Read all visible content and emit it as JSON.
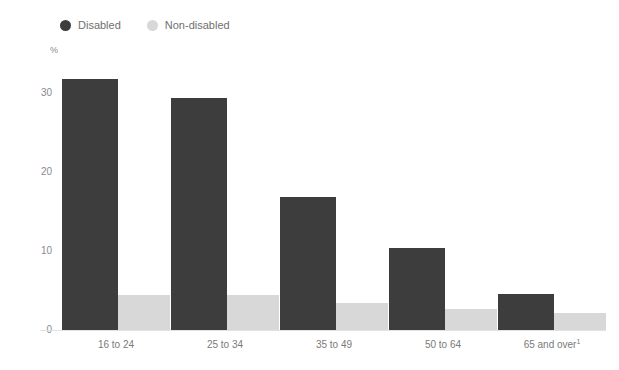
{
  "chart_data": {
    "type": "bar",
    "title": "",
    "subtitle": "",
    "xlabel": "",
    "ylabel": "%",
    "ylim": [
      0,
      33
    ],
    "yticks": [
      0,
      10,
      20,
      30
    ],
    "ytick_labels": [
      "0",
      "10",
      "20",
      "30"
    ],
    "grid": false,
    "legend_position": "top-left",
    "categories": [
      "16 to 24",
      "25 to 34",
      "35 to 49",
      "50 to 64",
      "65 and over¹"
    ],
    "series": [
      {
        "name": "Disabled",
        "color": "#3d3d3d",
        "values": [
          31.8,
          29.4,
          16.8,
          10.4,
          4.6
        ]
      },
      {
        "name": "Non-disabled",
        "color": "#d8d8d8",
        "values": [
          4.4,
          4.4,
          3.4,
          2.7,
          2.2
        ]
      }
    ]
  },
  "legend": {
    "items": [
      {
        "label": "Disabled",
        "color": "#3d3d3d"
      },
      {
        "label": "Non-disabled",
        "color": "#d8d8d8"
      }
    ]
  },
  "axis": {
    "unit": "%"
  },
  "colors": {
    "disabled": "#3d3d3d",
    "non_disabled": "#d8d8d8",
    "axis_text": "#8a8a8a",
    "baseline": "#e2e2e2",
    "background": "#ffffff"
  }
}
